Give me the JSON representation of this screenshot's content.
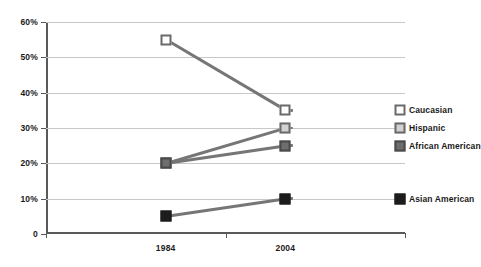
{
  "chart_data": {
    "type": "line",
    "title": "",
    "xlabel": "",
    "ylabel": "",
    "categories": [
      "1984",
      "2004"
    ],
    "x": [
      "1984",
      "2004"
    ],
    "ylim": [
      0,
      60
    ],
    "ytick_labels": [
      "0",
      "10%",
      "20%",
      "30%",
      "40%",
      "50%",
      "60%"
    ],
    "ytick_values": [
      0,
      10,
      20,
      30,
      40,
      50,
      60
    ],
    "grid": true,
    "legend_position": "right-inline",
    "series": [
      {
        "name": "Caucasian",
        "values": [
          55,
          35
        ],
        "marker": "white-square",
        "marker_fill": "#ffffff",
        "line_color": "#767676"
      },
      {
        "name": "Hispanic",
        "values": [
          20,
          30
        ],
        "marker": "light-gray-square",
        "marker_fill": "#d2d2d2",
        "line_color": "#767676"
      },
      {
        "name": "African American",
        "values": [
          20,
          25
        ],
        "marker": "dark-gray-square",
        "marker_fill": "#6e6e6e",
        "line_color": "#767676"
      },
      {
        "name": "Asian American",
        "values": [
          5,
          10
        ],
        "marker": "black-square",
        "marker_fill": "#1c1c1c",
        "line_color": "#767676"
      }
    ],
    "colors": {
      "axis": "#595959",
      "gridline": "#c8c8c8",
      "line": "#767676",
      "text": "#1a1a1a",
      "background": "#ffffff"
    }
  }
}
